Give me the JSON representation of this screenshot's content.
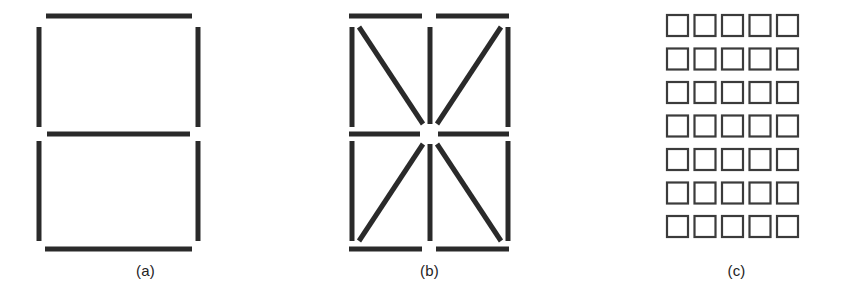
{
  "figure": {
    "background_color": "#ffffff",
    "stroke_color": "#2a2a2a",
    "square_stroke_color": "#3b3b3b",
    "panel_count": 3
  },
  "panels": [
    {
      "id": "a",
      "caption": "(a)",
      "kind": "divided-rectangle-outline",
      "description": "Rectangle outline divided by a middle horizontal bar, drawn as seven separate strokes with gaps at the junctions",
      "segments": [
        {
          "name": "top-horizontal",
          "type": "line",
          "x1": 46,
          "y1": 16,
          "x2": 192,
          "y2": 16
        },
        {
          "name": "middle-horizontal",
          "type": "line",
          "x1": 47,
          "y1": 134,
          "x2": 190,
          "y2": 134
        },
        {
          "name": "bottom-horizontal",
          "type": "line",
          "x1": 45,
          "y1": 249,
          "x2": 192,
          "y2": 249
        },
        {
          "name": "left-upper-vertical",
          "type": "line",
          "x1": 39,
          "y1": 27,
          "x2": 39,
          "y2": 127
        },
        {
          "name": "left-lower-vertical",
          "type": "line",
          "x1": 39,
          "y1": 141,
          "x2": 39,
          "y2": 241
        },
        {
          "name": "right-upper-vertical",
          "type": "line",
          "x1": 198,
          "y1": 27,
          "x2": 198,
          "y2": 127
        },
        {
          "name": "right-lower-vertical",
          "type": "line",
          "x1": 198,
          "y1": 141,
          "x2": 198,
          "y2": 241
        }
      ]
    },
    {
      "id": "b",
      "caption": "(b)",
      "kind": "divided-rectangle-with-diagonals",
      "description": "Same divided rectangle with an added vertical centre line and four diagonals radiating from the centre hub; every horizontal is split in two",
      "segments": [
        {
          "name": "top-horizontal-left",
          "type": "line",
          "x1": 64,
          "y1": 16,
          "x2": 137,
          "y2": 16
        },
        {
          "name": "top-horizontal-right",
          "type": "line",
          "x1": 151,
          "y1": 16,
          "x2": 224,
          "y2": 16
        },
        {
          "name": "middle-horizontal-left",
          "type": "line",
          "x1": 64,
          "y1": 134,
          "x2": 135,
          "y2": 134
        },
        {
          "name": "middle-horizontal-right",
          "type": "line",
          "x1": 153,
          "y1": 134,
          "x2": 224,
          "y2": 134
        },
        {
          "name": "bottom-horizontal-left",
          "type": "line",
          "x1": 64,
          "y1": 249,
          "x2": 137,
          "y2": 249
        },
        {
          "name": "bottom-horizontal-right",
          "type": "line",
          "x1": 151,
          "y1": 249,
          "x2": 224,
          "y2": 249
        },
        {
          "name": "left-upper-vertical",
          "type": "line",
          "x1": 67,
          "y1": 27,
          "x2": 67,
          "y2": 127
        },
        {
          "name": "left-lower-vertical",
          "type": "line",
          "x1": 67,
          "y1": 141,
          "x2": 67,
          "y2": 241
        },
        {
          "name": "right-upper-vertical",
          "type": "line",
          "x1": 223,
          "y1": 27,
          "x2": 223,
          "y2": 127
        },
        {
          "name": "right-lower-vertical",
          "type": "line",
          "x1": 223,
          "y1": 141,
          "x2": 223,
          "y2": 241
        },
        {
          "name": "centre-upper-vertical",
          "type": "line",
          "x1": 145,
          "y1": 27,
          "x2": 145,
          "y2": 124
        },
        {
          "name": "centre-lower-vertical",
          "type": "line",
          "x1": 145,
          "y1": 144,
          "x2": 145,
          "y2": 241
        },
        {
          "name": "diagonal-top-left-to-centre",
          "type": "line",
          "x1": 74,
          "y1": 27,
          "x2": 138,
          "y2": 124
        },
        {
          "name": "diagonal-top-right-to-centre",
          "type": "line",
          "x1": 216,
          "y1": 27,
          "x2": 152,
          "y2": 124
        },
        {
          "name": "diagonal-bottom-left-to-centre",
          "type": "line",
          "x1": 74,
          "y1": 241,
          "x2": 138,
          "y2": 144
        },
        {
          "name": "diagonal-bottom-right-to-centre",
          "type": "line",
          "x1": 216,
          "y1": 241,
          "x2": 152,
          "y2": 144
        }
      ]
    },
    {
      "id": "c",
      "caption": "(c)",
      "kind": "square-grid",
      "description": "Regular grid of small open squares",
      "grid": {
        "columns": 5,
        "rows": 7,
        "total_squares": 35,
        "square_size": 21,
        "column_pitch": 27.5,
        "row_pitch": 33.5,
        "origin_x": 97,
        "origin_y": 15
      }
    }
  ]
}
